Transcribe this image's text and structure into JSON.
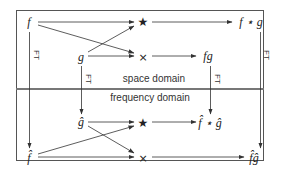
{
  "diagram": {
    "regions": {
      "top_label": "space domain",
      "bottom_label": "frequency domain"
    },
    "nodes": {
      "f": "f",
      "g": "g",
      "conv_op_top": "★",
      "mult_op_top": "×",
      "f_conv_g": "f ⋆ g",
      "fg": "fg",
      "g_hat": "ĝ",
      "f_hat": "f̂",
      "conv_op_bottom": "★",
      "mult_op_bottom": "×",
      "fhat_conv_ghat": "f̂ ⋆ ĝ",
      "fhat_ghat": "f̂ĝ"
    },
    "transform_label": "FT",
    "colors": {
      "line": "#333333",
      "border": "#555555",
      "separator": "#777777",
      "background": "#ffffff"
    },
    "edges": [
      {
        "from": "f",
        "to": "conv_op_top"
      },
      {
        "from": "f",
        "to": "mult_op_top"
      },
      {
        "from": "g",
        "to": "conv_op_top"
      },
      {
        "from": "g",
        "to": "mult_op_top"
      },
      {
        "from": "conv_op_top",
        "to": "f_conv_g"
      },
      {
        "from": "mult_op_top",
        "to": "fg"
      },
      {
        "from": "f",
        "to": "f_hat",
        "label": "FT"
      },
      {
        "from": "g",
        "to": "g_hat",
        "label": "FT"
      },
      {
        "from": "fg",
        "to": "fhat_conv_ghat",
        "label": "FT"
      },
      {
        "from": "f_conv_g",
        "to": "fhat_ghat",
        "label": "FT"
      },
      {
        "from": "g_hat",
        "to": "conv_op_bottom"
      },
      {
        "from": "g_hat",
        "to": "mult_op_bottom"
      },
      {
        "from": "f_hat",
        "to": "conv_op_bottom"
      },
      {
        "from": "f_hat",
        "to": "mult_op_bottom"
      },
      {
        "from": "conv_op_bottom",
        "to": "fhat_conv_ghat"
      },
      {
        "from": "mult_op_bottom",
        "to": "fhat_ghat"
      }
    ]
  }
}
